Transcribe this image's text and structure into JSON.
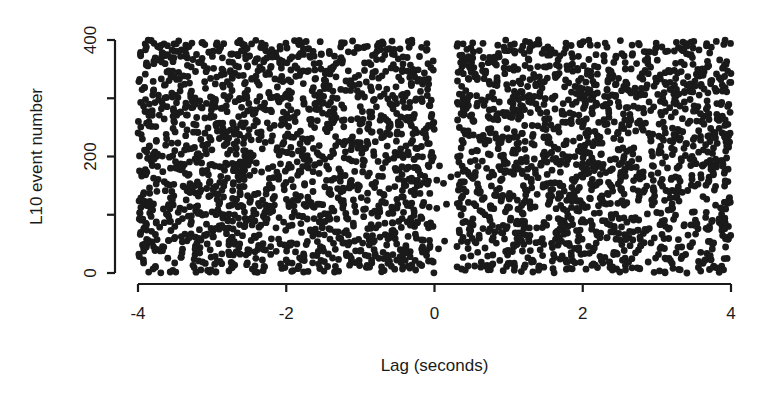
{
  "chart_data": {
    "type": "scatter",
    "title": "",
    "xlabel": "Lag (seconds)",
    "ylabel": "L10 event number",
    "xlim": [
      -4,
      4
    ],
    "ylim": [
      0,
      400
    ],
    "x_ticks": [
      -4,
      -2,
      0,
      2,
      4
    ],
    "x_tick_labels": [
      "-4",
      "-2",
      "0",
      "2",
      "4"
    ],
    "y_ticks": [
      0,
      100,
      200,
      300,
      400
    ],
    "y_tick_labels": [
      "0",
      "",
      "200",
      "",
      "400"
    ],
    "grid": false,
    "legend": null,
    "marker_color": "#1a1a1a",
    "series": [
      {
        "name": "events",
        "description": "Dense uniform scatter of lags for ~400 events; points fill -4..0 and ~0.3..4 s, with an empty gap between 0 and ~0.3 s containing only a few sparse points near the bottom (y ≈ 40–150).",
        "regions": [
          {
            "x_range": [
              -4,
              0
            ],
            "y_range": [
              0,
              400
            ],
            "approx_points": 1700
          },
          {
            "x_range": [
              0.3,
              4
            ],
            "y_range": [
              0,
              400
            ],
            "approx_points": 1550
          },
          {
            "x_range": [
              0.0,
              0.3
            ],
            "y_range": [
              40,
              200
            ],
            "approx_points": 8
          }
        ]
      }
    ]
  },
  "axes": {
    "x_title": "Lag (seconds)",
    "y_title": "L10 event number",
    "x_tick_labels": [
      "-4",
      "-2",
      "0",
      "2",
      "4"
    ],
    "y_tick_labels": [
      "0",
      "200",
      "400"
    ]
  }
}
